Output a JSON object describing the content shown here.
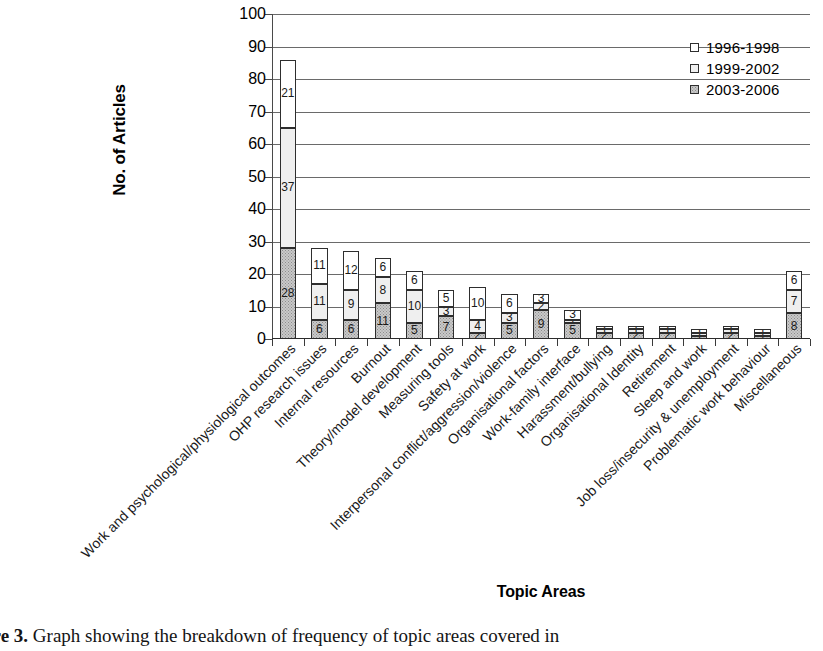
{
  "figure": {
    "caption_prefix": "ure 3.",
    "caption_text": "Graph showing the breakdown of frequency of topic areas covered in"
  },
  "chart_data": {
    "type": "bar",
    "subtype": "stacked-vertical",
    "title": "",
    "xlabel": "Topic Areas",
    "ylabel": "No. of Articles",
    "ylim": [
      0,
      100
    ],
    "ytick_step": 10,
    "yticks": [
      0,
      10,
      20,
      30,
      40,
      50,
      60,
      70,
      80,
      90,
      100
    ],
    "grid": "horizontal",
    "legend_position": "top-right",
    "categories": [
      "Work and psychological/physiological outcomes",
      "OHP research issues",
      "Internal resources",
      "Burnout",
      "Theory/model development",
      "Measuring tools",
      "Safety at work",
      "Interpersonal conflict/aggression/violence",
      "Organisational factors",
      "Work-family interface",
      "Harassment/bullying",
      "Organisational Identity",
      "Retirement",
      "Sleep and work",
      "Job loss/insecurity & unemployment",
      "Problematic work behaviour",
      "Miscellaneous"
    ],
    "series": [
      {
        "name": "2003-2006",
        "stack_order": 0,
        "color": "#c9c9c9",
        "pattern": "dotted-hatch",
        "values": [
          28,
          6,
          6,
          11,
          5,
          7,
          2,
          5,
          9,
          5,
          2,
          2,
          2,
          1,
          2,
          1,
          8
        ]
      },
      {
        "name": "1999-2002",
        "stack_order": 1,
        "color": "#efefef",
        "pattern": "solid-light",
        "values": [
          37,
          11,
          9,
          8,
          10,
          3,
          4,
          3,
          2,
          1,
          1,
          1,
          1,
          1,
          1,
          1,
          7
        ]
      },
      {
        "name": "1996-1998",
        "stack_order": 2,
        "color": "#ffffff",
        "pattern": "open",
        "values": [
          21,
          11,
          12,
          6,
          6,
          5,
          10,
          6,
          3,
          3,
          1,
          1,
          1,
          1,
          1,
          1,
          6
        ]
      }
    ],
    "totals": [
      86,
      28,
      27,
      25,
      21,
      15,
      16,
      14,
      14,
      9,
      4,
      4,
      4,
      3,
      4,
      3,
      21
    ]
  },
  "legend": {
    "entries": [
      {
        "label": "1996-1998",
        "swatch": "open"
      },
      {
        "label": "1999-2002",
        "swatch": "solid-light"
      },
      {
        "label": "2003-2006",
        "swatch": "dotted-hatch"
      }
    ]
  }
}
